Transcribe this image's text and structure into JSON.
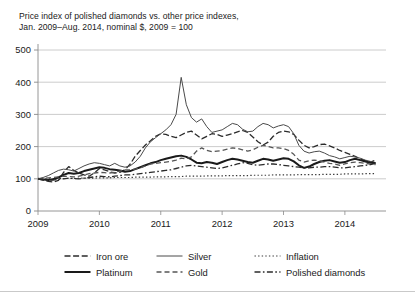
{
  "chart_data": {
    "type": "line",
    "title": "Price index of polished diamonds vs. other price indexes,\nJan. 2009–Aug. 2014, nominal $, 2009 = 100",
    "title_line1": "Price index of polished diamonds vs. other price indexes,",
    "title_line2": "Jan. 2009–Aug. 2014, nominal $, 2009 = 100",
    "xlabel": "",
    "ylabel": "",
    "xlim": [
      2009.0,
      2014.67
    ],
    "ylim": [
      0,
      500
    ],
    "yticks": [
      0,
      100,
      200,
      300,
      400,
      500
    ],
    "ytick_labels": [
      "0",
      "100",
      "200",
      "300",
      "400",
      "500"
    ],
    "xticks": [
      2009,
      2010,
      2011,
      2012,
      2013,
      2014
    ],
    "xtick_labels": [
      "2009",
      "2010",
      "2011",
      "2012",
      "2013",
      "2014"
    ],
    "grid": "horizontal",
    "legend_position": "below",
    "x": [
      2009.0,
      2009.083,
      2009.167,
      2009.25,
      2009.333,
      2009.417,
      2009.5,
      2009.583,
      2009.667,
      2009.75,
      2009.833,
      2009.917,
      2010.0,
      2010.083,
      2010.167,
      2010.25,
      2010.333,
      2010.417,
      2010.5,
      2010.583,
      2010.667,
      2010.75,
      2010.833,
      2010.917,
      2011.0,
      2011.083,
      2011.167,
      2011.25,
      2011.333,
      2011.417,
      2011.5,
      2011.583,
      2011.667,
      2011.75,
      2011.833,
      2011.917,
      2012.0,
      2012.083,
      2012.167,
      2012.25,
      2012.333,
      2012.417,
      2012.5,
      2012.583,
      2012.667,
      2012.75,
      2012.833,
      2012.917,
      2013.0,
      2013.083,
      2013.167,
      2013.25,
      2013.333,
      2013.417,
      2013.5,
      2013.583,
      2013.667,
      2013.75,
      2013.833,
      2013.917,
      2014.0,
      2014.083,
      2014.167,
      2014.25,
      2014.333,
      2014.417,
      2014.5
    ],
    "series": [
      {
        "name": "Iron ore",
        "style": "dash-dot",
        "width": 1.3,
        "color": "#2b2b2b",
        "values": [
          100,
          96,
          92,
          90,
          95,
          120,
          138,
          126,
          118,
          112,
          108,
          118,
          132,
          128,
          122,
          118,
          120,
          128,
          145,
          170,
          188,
          205,
          218,
          232,
          240,
          238,
          232,
          228,
          236,
          244,
          248,
          236,
          224,
          232,
          240,
          238,
          232,
          236,
          240,
          246,
          250,
          244,
          230,
          215,
          205,
          214,
          232,
          244,
          248,
          246,
          238,
          220,
          204,
          196,
          200,
          206,
          208,
          202,
          196,
          188,
          182,
          176,
          170,
          162,
          156,
          152,
          158
        ]
      },
      {
        "name": "Silver",
        "style": "solid-thin",
        "width": 1.0,
        "color": "#4a4a4a",
        "values": [
          100,
          104,
          110,
          118,
          126,
          130,
          128,
          124,
          132,
          140,
          146,
          150,
          148,
          144,
          140,
          148,
          140,
          136,
          140,
          152,
          170,
          196,
          215,
          228,
          240,
          252,
          268,
          300,
          415,
          330,
          290,
          276,
          286,
          262,
          244,
          248,
          252,
          262,
          272,
          268,
          254,
          246,
          248,
          262,
          272,
          268,
          258,
          264,
          268,
          262,
          240,
          204,
          186,
          180,
          184,
          186,
          180,
          172,
          168,
          162,
          166,
          170,
          168,
          164,
          158,
          154,
          150
        ]
      },
      {
        "name": "Inflation",
        "style": "dotted",
        "width": 1.2,
        "color": "#3a3a3a",
        "values": [
          100,
          100,
          100,
          100,
          101,
          101,
          101,
          101,
          102,
          102,
          102,
          102,
          103,
          103,
          103,
          104,
          104,
          104,
          104,
          105,
          105,
          105,
          105,
          106,
          106,
          106,
          107,
          107,
          107,
          108,
          108,
          108,
          108,
          109,
          109,
          109,
          109,
          110,
          110,
          110,
          110,
          110,
          111,
          111,
          111,
          111,
          112,
          112,
          112,
          112,
          112,
          113,
          113,
          113,
          113,
          113,
          114,
          114,
          114,
          114,
          115,
          115,
          115,
          115,
          116,
          116,
          116
        ]
      },
      {
        "name": "Platinum",
        "style": "solid-thick",
        "width": 2.0,
        "color": "#1a1a1a",
        "values": [
          100,
          98,
          96,
          99,
          104,
          112,
          118,
          116,
          118,
          124,
          128,
          132,
          136,
          134,
          130,
          128,
          126,
          122,
          124,
          130,
          136,
          142,
          148,
          152,
          158,
          162,
          166,
          170,
          172,
          168,
          160,
          150,
          148,
          152,
          150,
          146,
          152,
          158,
          162,
          160,
          156,
          152,
          150,
          156,
          162,
          160,
          156,
          160,
          164,
          162,
          154,
          142,
          134,
          138,
          146,
          152,
          156,
          158,
          154,
          150,
          152,
          158,
          162,
          158,
          154,
          150,
          148
        ]
      },
      {
        "name": "Gold",
        "style": "dashed",
        "width": 1.3,
        "color": "#555555",
        "values": [
          100,
          101,
          103,
          104,
          106,
          108,
          107,
          106,
          108,
          112,
          116,
          118,
          120,
          119,
          118,
          120,
          124,
          128,
          128,
          130,
          134,
          140,
          146,
          148,
          150,
          152,
          154,
          158,
          164,
          162,
          168,
          186,
          196,
          188,
          184,
          186,
          188,
          192,
          196,
          194,
          190,
          186,
          190,
          198,
          204,
          200,
          196,
          196,
          194,
          188,
          176,
          158,
          152,
          156,
          158,
          156,
          152,
          148,
          146,
          142,
          146,
          150,
          152,
          150,
          148,
          146,
          144
        ]
      },
      {
        "name": "Polished diamonds",
        "style": "dash-dot-dot",
        "width": 1.3,
        "color": "#2b2b2b",
        "values": [
          100,
          98,
          96,
          96,
          98,
          100,
          102,
          101,
          100,
          102,
          104,
          106,
          108,
          107,
          106,
          108,
          110,
          112,
          112,
          114,
          116,
          118,
          120,
          122,
          124,
          126,
          128,
          132,
          136,
          140,
          142,
          140,
          138,
          136,
          134,
          132,
          134,
          138,
          142,
          146,
          150,
          148,
          144,
          142,
          144,
          146,
          146,
          144,
          142,
          140,
          138,
          136,
          134,
          134,
          136,
          136,
          138,
          138,
          136,
          134,
          134,
          136,
          138,
          140,
          142,
          144,
          148
        ]
      }
    ]
  },
  "legend": {
    "rows": [
      [
        {
          "name": "Iron ore",
          "style": "dash-dot"
        },
        {
          "name": "Silver",
          "style": "solid-thin"
        },
        {
          "name": "Inflation",
          "style": "dotted"
        }
      ],
      [
        {
          "name": "Platinum",
          "style": "solid-thick"
        },
        {
          "name": "Gold",
          "style": "dashed"
        },
        {
          "name": "Polished diamonds",
          "style": "dash-dot-dot"
        }
      ]
    ]
  }
}
